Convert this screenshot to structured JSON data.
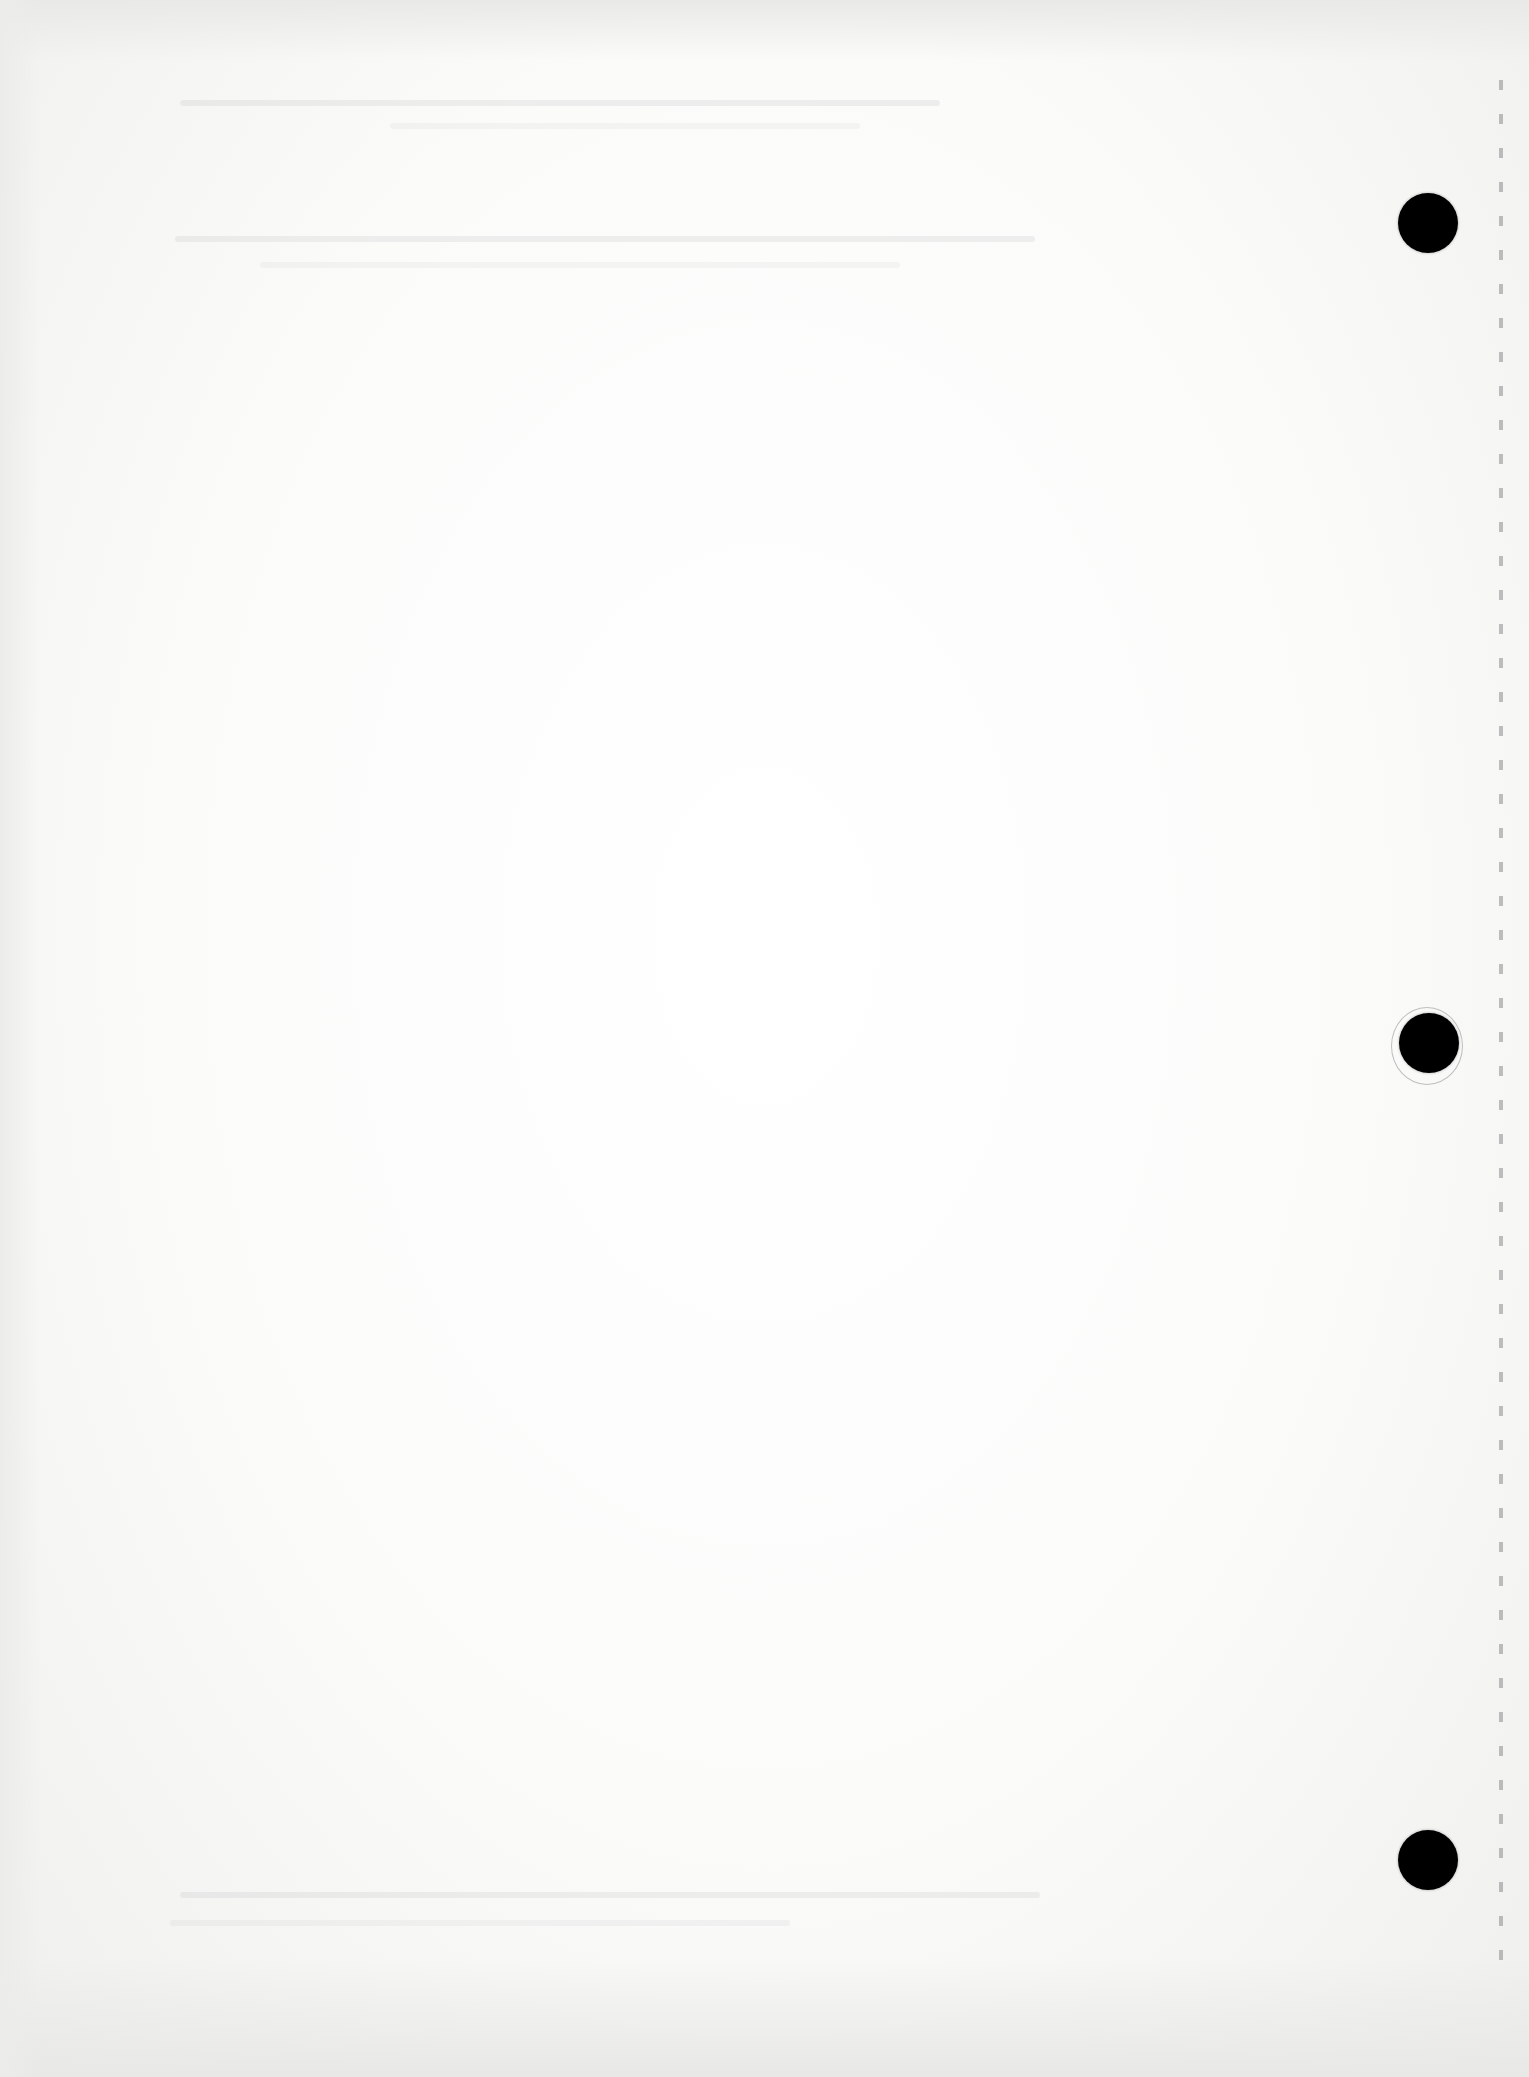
{
  "document": {
    "type": "blank scanned loose-leaf page",
    "text_content": "",
    "colors": {
      "paper": "#fbfbfa",
      "hole": "#000000",
      "perforation": "#8c8c8c"
    },
    "holes": [
      {
        "id": "top",
        "cx": 1428,
        "cy": 223,
        "r": 30
      },
      {
        "id": "middle",
        "cx": 1429,
        "cy": 1043,
        "r": 30
      },
      {
        "id": "bottom",
        "cx": 1428,
        "cy": 1860,
        "r": 30
      }
    ],
    "right_edge": "perforated"
  }
}
